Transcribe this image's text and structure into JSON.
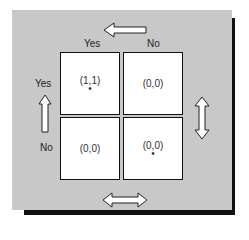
{
  "top_labels": {
    "left": "Yes",
    "right": "No"
  },
  "side_labels": {
    "top": "Yes",
    "bottom": "No"
  },
  "matrix": [
    [
      {
        "payoff": "(1,1)",
        "starred": true
      },
      {
        "payoff": "(0,0)",
        "starred": false
      }
    ],
    [
      {
        "payoff": "(0,0)",
        "starred": false
      },
      {
        "payoff": "(0,0)",
        "starred": true
      }
    ]
  ],
  "dot": "•",
  "icons": [
    "arrow-left-icon",
    "arrow-up-icon",
    "arrow-updown-icon",
    "arrow-leftright-icon"
  ],
  "colors": {
    "panel": "#c8c8c8",
    "shadow": "#111111",
    "cell": "#ffffff"
  }
}
